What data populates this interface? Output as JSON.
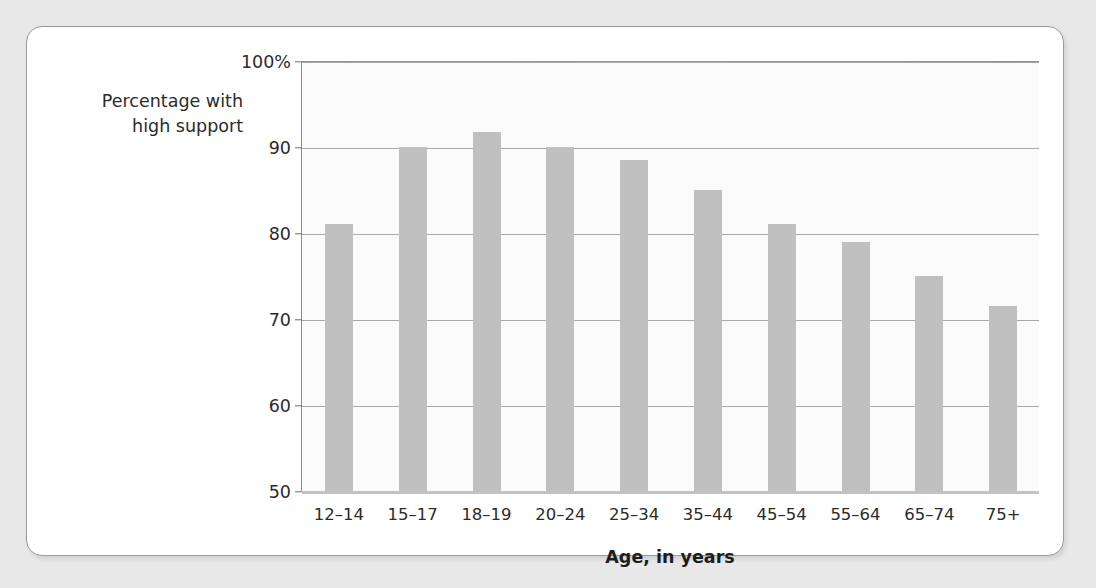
{
  "chart_data": {
    "type": "bar",
    "title": "",
    "xlabel": "Age, in years",
    "ylabel": "Percentage with\nhigh support",
    "categories": [
      "12–14",
      "15–17",
      "18–19",
      "20–24",
      "25–34",
      "35–44",
      "45–54",
      "55–64",
      "65–74",
      "75+"
    ],
    "values": [
      81,
      90,
      91.7,
      90,
      88.5,
      85,
      81,
      79,
      75,
      71.5
    ],
    "ylim": [
      50,
      100
    ],
    "ytick_labels": [
      "100%",
      "90",
      "80",
      "70",
      "60",
      "50"
    ],
    "ytick_values": [
      100,
      90,
      80,
      70,
      60,
      50
    ],
    "grid": true,
    "legend": false,
    "bar_color": "#c0c0c0",
    "gridline_color": "#a9a9a9",
    "axis_color": "#8d8d8d",
    "plot_background": "#fbfbfb",
    "card_background": "#ffffff",
    "page_background": "#e8e8e8"
  }
}
